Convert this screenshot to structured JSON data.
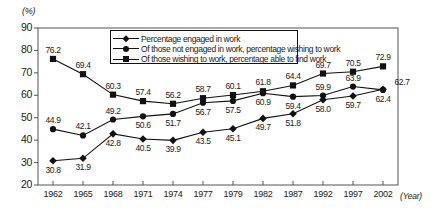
{
  "chart_data": {
    "type": "line",
    "title": "",
    "xlabel": "Year",
    "ylabel": "(%)",
    "ylim": [
      20,
      90
    ],
    "yticks": [
      90,
      80,
      70,
      60,
      50,
      40,
      30,
      20
    ],
    "grid": false,
    "legend_position": "top-center-inside",
    "categories": [
      "1962",
      "1965",
      "1968",
      "1971",
      "1974",
      "1977",
      "1979",
      "1982",
      "1987",
      "1992",
      "1997",
      "2002"
    ],
    "series": [
      {
        "name": "Percentage engaged in work",
        "marker": "diamond",
        "values": [
          30.8,
          31.9,
          42.8,
          40.5,
          39.9,
          43.5,
          45.1,
          49.7,
          51.8,
          58.0,
          59.7,
          62.7
        ],
        "label_positions": [
          "below",
          "below",
          "below",
          "below",
          "below",
          "below",
          "below",
          "below",
          "below",
          "below",
          "below",
          "right"
        ]
      },
      {
        "name": "Of those not engaged in work, percentage wishing to work",
        "marker": "circle",
        "values": [
          44.9,
          42.1,
          49.2,
          50.6,
          51.7,
          56.7,
          57.5,
          60.9,
          59.4,
          59.9,
          63.9,
          62.4
        ],
        "label_positions": [
          "above",
          "above",
          "above",
          "below",
          "below",
          "below",
          "below",
          "below",
          "below",
          "above",
          "above",
          "below"
        ]
      },
      {
        "name": "Of those wishing to work, percentage able to find work",
        "marker": "square",
        "values": [
          76.2,
          69.4,
          60.3,
          57.4,
          56.2,
          58.7,
          60.1,
          61.8,
          64.4,
          69.7,
          70.5,
          72.9
        ],
        "label_positions": [
          "above",
          "above",
          "above",
          "above",
          "above",
          "above",
          "above",
          "above",
          "above",
          "above",
          "above",
          "above"
        ]
      }
    ],
    "colors": {
      "line": "#111111",
      "marker": "#111111",
      "axis": "#555555",
      "text": "#1a1a1a",
      "background": "#ffffff"
    }
  }
}
